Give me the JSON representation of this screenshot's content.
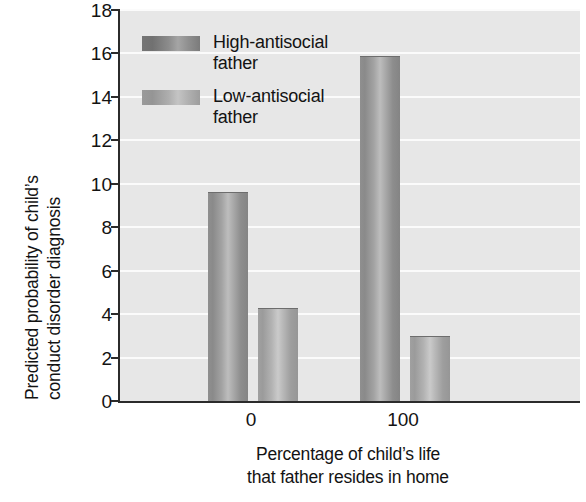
{
  "chart_data": {
    "type": "bar",
    "title": "",
    "xlabel": "Percentage of child's life that father resides in home",
    "xlabel_line1": "Percentage of child’s life",
    "xlabel_line2": "that father resides in home",
    "ylabel": "Predicted probability of child's conduct disorder diagnosis",
    "ylabel_line1": "Predicted probability of child’s",
    "ylabel_line2": "conduct disorder diagnosis",
    "categories": [
      "0",
      "100"
    ],
    "series": [
      {
        "name": "High-antisocial father",
        "values": [
          9.6,
          15.9
        ]
      },
      {
        "name": "Low-antisocial father",
        "values": [
          4.3,
          3.0
        ]
      }
    ],
    "ylim": [
      0,
      18
    ],
    "ytick_values": [
      0,
      2,
      4,
      6,
      8,
      10,
      12,
      14,
      16,
      18
    ],
    "ytick_labels": [
      "0",
      "2",
      "4",
      "6",
      "8",
      "10",
      "12",
      "14",
      "16",
      "18"
    ],
    "xtick_labels": [
      "0",
      "100"
    ],
    "grid": true,
    "grid_color": "#fbfbfb",
    "plot_background": "#e7e7e7",
    "legend_position": "upper-left-inside",
    "legend": [
      {
        "label_line1": "High-antisocial",
        "label_line2": "father",
        "swatch": "high"
      },
      {
        "label_line1": "Low-antisocial",
        "label_line2": "father",
        "swatch": "low"
      }
    ],
    "series_colors": {
      "high": "#8f8f8f",
      "low": "#b0b0b0"
    },
    "axis_color": "#2b2b2b"
  }
}
